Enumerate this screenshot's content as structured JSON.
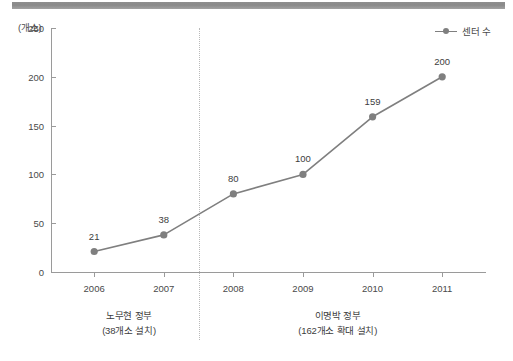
{
  "chart_data": {
    "type": "line",
    "title": "",
    "subtitle": "",
    "xlabel": "",
    "ylabel": "(개소)",
    "unit_label": "(개소)",
    "categories": [
      "2006",
      "2007",
      "2008",
      "2009",
      "2010",
      "2011"
    ],
    "values": [
      21,
      38,
      80,
      100,
      159,
      200
    ],
    "point_labels": [
      "21",
      "38",
      "80",
      "100",
      "159",
      "200"
    ],
    "series": [
      {
        "name": "센터 수",
        "values": [
          21,
          38,
          80,
          100,
          159,
          200
        ]
      }
    ],
    "ylim": [
      0,
      250
    ],
    "yticks": [
      0,
      50,
      100,
      150,
      200,
      250
    ],
    "ytick_labels": [
      "0",
      "50",
      "100",
      "150",
      "200",
      "250"
    ],
    "grid": false,
    "legend": {
      "position": "top-right",
      "entries": [
        "센터 수"
      ]
    },
    "series_color": "#7f7f7f",
    "marker_color": "#7f7f7f",
    "annotations": [
      {
        "name": "era-left",
        "title": "노무현 정부",
        "subtitle": "(38개소 설치)",
        "span": [
          "2006",
          "2007"
        ]
      },
      {
        "name": "era-right",
        "title": "이명박 정부",
        "subtitle": "(162개소 확대 설치)",
        "span": [
          "2008",
          "2011"
        ]
      }
    ],
    "divider": {
      "type": "dotted-vertical",
      "between": [
        "2007",
        "2008"
      ]
    }
  },
  "legend": {
    "label": "센터 수"
  },
  "axis": {
    "unit": "(개소)"
  },
  "colors": {
    "line": "#7f7f7f",
    "marker": "#7f7f7f",
    "axis": "#9a9a9a",
    "text": "#3d3d3d",
    "top_bar": "#8e8e8e",
    "divider": "#b9b9b9"
  }
}
